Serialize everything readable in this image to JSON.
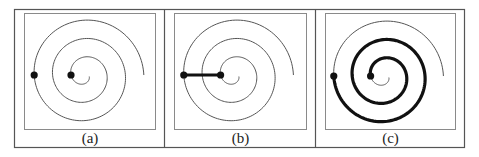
{
  "figure": {
    "outer_frame": {
      "x": 14.5,
      "y": 9.5,
      "width": 450,
      "height": 138,
      "stroke": "#555555"
    },
    "dividers": [
      164.5,
      315.5
    ],
    "colors": {
      "frame": "#555555",
      "inner_box": "#8a8a8a",
      "spiral_thin": "#555555",
      "spiral_thick": "#111111",
      "dot": "#111111",
      "caption": "#222222"
    }
  },
  "spiral": {
    "type": "archimedean",
    "a": 2.93,
    "r0": 4.2,
    "theta_start": 0.3,
    "theta_end": 18.85,
    "center_offset_from_panel_left": {
      "x": 70.0,
      "y": 75
    }
  },
  "panels": [
    {
      "id": "a",
      "caption": "(a)",
      "left": 14.5,
      "inner_box": {
        "x": 24.5,
        "y": 13.5,
        "width": 131,
        "height": 116
      },
      "center": {
        "x": 84.4,
        "y": 75
      },
      "dots": [
        {
          "theta": 3.1416
        },
        {
          "theta": 15.708
        }
      ],
      "highlight": "none"
    },
    {
      "id": "b",
      "caption": "(b)",
      "left": 164.5,
      "inner_box": {
        "x": 174.5,
        "y": 13.5,
        "width": 132,
        "height": 116
      },
      "center": {
        "x": 234.0,
        "y": 75
      },
      "dots": [
        {
          "theta": 3.1416
        },
        {
          "theta": 15.708
        }
      ],
      "highlight": "straight-segment"
    },
    {
      "id": "c",
      "caption": "(c)",
      "left": 315.5,
      "inner_box": {
        "x": 325.5,
        "y": 13.5,
        "width": 130,
        "height": 116
      },
      "center": {
        "x": 384.0,
        "y": 76
      },
      "dots": [
        {
          "theta": 3.1416
        },
        {
          "theta": 15.708
        }
      ],
      "highlight": "spiral-arc"
    }
  ]
}
